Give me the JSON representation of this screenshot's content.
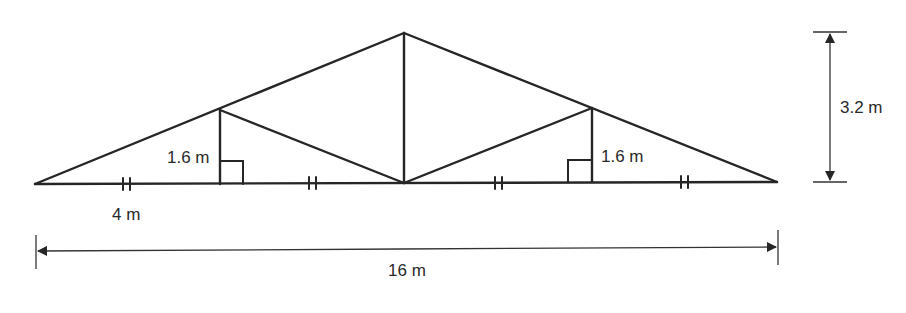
{
  "diagram": {
    "type": "roof truss",
    "labels": {
      "left_vertical": "1.6 m",
      "right_vertical": "1.6 m",
      "segment": "4 m",
      "total_span": "16 m",
      "height": "3.2 m"
    },
    "markers": {
      "tick_marks": "double tick marks on each of 4 equal base segments",
      "right_angles": "right angle squares at base of both verticals"
    }
  }
}
